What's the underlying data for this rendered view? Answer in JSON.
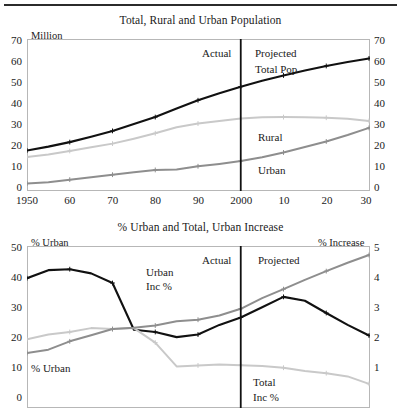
{
  "figure": {
    "divider_rule": "horizontal-rule-top"
  },
  "charts": [
    {
      "id": "top",
      "title": "Total, Rural and Urban Population",
      "left_axis_label": "Million",
      "right_axis_label": "",
      "left_ticks": [
        "70",
        "60",
        "50",
        "40",
        "30",
        "20",
        "10",
        "0"
      ],
      "right_ticks": [
        "70",
        "60",
        "50",
        "40",
        "30",
        "20",
        "10",
        "0"
      ],
      "x_ticks": [
        "1950",
        "60",
        "70",
        "80",
        "90",
        "2000",
        "10",
        "20",
        "30"
      ],
      "annotations": {
        "actual": "Actual",
        "projected": "Projected"
      },
      "series_labels": {
        "total": "Total Pop",
        "rural": "Rural",
        "urban": "Urban"
      }
    },
    {
      "id": "bottom",
      "title": "% Urban and Total, Urban Increase",
      "left_axis_label": "% Urban",
      "right_axis_label": "% Increase",
      "left_ticks": [
        "50",
        "40",
        "30",
        "20",
        "10",
        "0"
      ],
      "right_ticks": [
        "5",
        "4",
        "3",
        "2",
        "1"
      ],
      "x_ticks": [],
      "annotations": {
        "actual": "Actual",
        "projected": "Projected"
      },
      "series_labels": {
        "urban_inc": "Urban Inc %",
        "urban_inc_line1": "Urban",
        "urban_inc_line2": "Inc %",
        "pct_urban": "% Urban",
        "total_inc_line1": "Total",
        "total_inc_line2": "Inc %"
      }
    }
  ],
  "colors": {
    "total_pop": "#111111",
    "rural": "#c9c9c9",
    "urban": "#8e8e8e",
    "axis": "#b7b7b7",
    "divider": "#111111",
    "text": "#1a1a1a"
  },
  "chart_data": [
    {
      "type": "line",
      "title": "Total, Rural and Urban Population",
      "xlabel": "",
      "ylabel": "Million",
      "x": [
        1950,
        1955,
        1960,
        1965,
        1970,
        1975,
        1980,
        1985,
        1990,
        1995,
        2000,
        2005,
        2010,
        2015,
        2020,
        2025,
        2030
      ],
      "x_tick_labels": [
        "1950",
        "60",
        "70",
        "80",
        "90",
        "2000",
        "10",
        "20",
        "30"
      ],
      "x_tick_values": [
        1950,
        1960,
        1970,
        1980,
        1990,
        2000,
        2010,
        2020,
        2030
      ],
      "ylim": [
        0,
        70
      ],
      "y_ticks": [
        0,
        10,
        20,
        30,
        40,
        50,
        60,
        70
      ],
      "right_ylim": [
        0,
        70
      ],
      "right_y_ticks": [
        0,
        10,
        20,
        30,
        40,
        50,
        60,
        70
      ],
      "grid": false,
      "legend": "inline-labels",
      "divider_x": 2000,
      "divider_labels": {
        "left": "Actual",
        "right": "Projected"
      },
      "series": [
        {
          "name": "Total Pop",
          "color": "#111111",
          "values": [
            18.3,
            20.1,
            22.2,
            24.7,
            27.4,
            30.6,
            33.8,
            37.8,
            41.6,
            44.9,
            47.9,
            50.6,
            53.1,
            55.4,
            57.5,
            59.3,
            61.0
          ]
        },
        {
          "name": "Rural",
          "color": "#c9c9c9",
          "values": [
            15.3,
            16.5,
            18.1,
            19.8,
            21.5,
            23.8,
            26.3,
            29.1,
            30.8,
            32.0,
            33.1,
            33.7,
            33.8,
            33.7,
            33.5,
            33.0,
            32.0
          ]
        },
        {
          "name": "Urban",
          "color": "#8e8e8e",
          "values": [
            3.0,
            3.6,
            4.8,
            5.9,
            7.1,
            8.2,
            9.3,
            9.5,
            11.0,
            12.1,
            13.4,
            15.2,
            17.4,
            19.9,
            22.5,
            25.5,
            28.8
          ]
        }
      ]
    },
    {
      "type": "line",
      "title": "% Urban and Total, Urban Increase",
      "xlabel": "",
      "ylabel": "% Urban",
      "right_ylabel": "% Increase",
      "x": [
        1950,
        1955,
        1960,
        1965,
        1970,
        1975,
        1980,
        1985,
        1990,
        1995,
        2000,
        2005,
        2010,
        2015,
        2020,
        2025,
        2030
      ],
      "ylim": [
        0,
        50
      ],
      "y_ticks": [
        0,
        10,
        20,
        30,
        40,
        50
      ],
      "right_ylim": [
        0,
        5
      ],
      "right_y_ticks": [
        1,
        2,
        3,
        4,
        5
      ],
      "grid": false,
      "legend": "inline-labels",
      "divider_x": 2000,
      "divider_labels": {
        "left": "Actual",
        "right": "Projected"
      },
      "series": [
        {
          "name": "Urban Inc %",
          "axis": "right",
          "color": "#111111",
          "values": [
            4.0,
            4.25,
            4.28,
            4.15,
            3.85,
            2.4,
            2.33,
            2.17,
            2.25,
            2.55,
            2.78,
            3.1,
            3.42,
            3.3,
            2.92,
            2.55,
            2.22
          ]
        },
        {
          "name": "Total Inc %",
          "axis": "right",
          "color": "#c9c9c9",
          "values": [
            2.1,
            2.25,
            2.33,
            2.45,
            2.42,
            2.45,
            2.0,
            1.26,
            1.29,
            1.32,
            1.3,
            1.27,
            1.22,
            1.12,
            1.05,
            0.95,
            0.72
          ]
        },
        {
          "name": "% Urban",
          "axis": "left",
          "color": "#8e8e8e",
          "values": [
            16.8,
            17.8,
            20.4,
            22.3,
            24.2,
            24.6,
            25.3,
            26.6,
            27.1,
            28.4,
            30.5,
            33.8,
            36.6,
            39.5,
            42.2,
            44.8,
            47.2
          ]
        }
      ]
    }
  ]
}
